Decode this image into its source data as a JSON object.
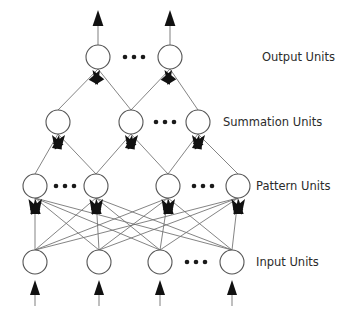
{
  "diagram": {
    "layers": [
      {
        "id": "output",
        "label": "Output Units",
        "label_x": 262,
        "label_y": 57,
        "y": 57,
        "radius": 12,
        "nodes": [
          {
            "name": "output-unit-1",
            "x": 98
          },
          {
            "name": "output-unit-2",
            "x": 170
          }
        ],
        "ellipses": [
          {
            "name": "output-ellipsis",
            "x": 134,
            "y": 57
          }
        ]
      },
      {
        "id": "summation",
        "label": "Summation Units",
        "label_x": 223,
        "label_y": 122,
        "y": 122,
        "radius": 12,
        "nodes": [
          {
            "name": "summation-unit-1",
            "x": 58
          },
          {
            "name": "summation-unit-2",
            "x": 131
          },
          {
            "name": "summation-unit-3",
            "x": 198
          }
        ],
        "ellipses": [
          {
            "name": "summation-ellipsis",
            "x": 165,
            "y": 122
          }
        ]
      },
      {
        "id": "pattern",
        "label": "Pattern Units",
        "label_x": 256,
        "label_y": 186,
        "y": 186,
        "radius": 12,
        "nodes": [
          {
            "name": "pattern-unit-1",
            "x": 35
          },
          {
            "name": "pattern-unit-2",
            "x": 96
          },
          {
            "name": "pattern-unit-3",
            "x": 168
          },
          {
            "name": "pattern-unit-4",
            "x": 238
          }
        ],
        "ellipses": [
          {
            "name": "pattern-ellipsis-left",
            "x": 65,
            "y": 186
          },
          {
            "name": "pattern-ellipsis-right",
            "x": 203,
            "y": 186
          }
        ]
      },
      {
        "id": "input",
        "label": "Input Units",
        "label_x": 256,
        "label_y": 262,
        "y": 262,
        "radius": 12,
        "nodes": [
          {
            "name": "input-unit-1",
            "x": 35
          },
          {
            "name": "input-unit-2",
            "x": 99
          },
          {
            "name": "input-unit-3",
            "x": 160
          },
          {
            "name": "input-unit-4",
            "x": 232
          }
        ],
        "ellipses": [
          {
            "name": "input-ellipsis",
            "x": 196,
            "y": 262
          }
        ]
      }
    ],
    "connections": {
      "input_to_pattern": "full",
      "pattern_to_summation": [
        {
          "from": 0,
          "to": 0
        },
        {
          "from": 1,
          "to": 0
        },
        {
          "from": 1,
          "to": 1
        },
        {
          "from": 2,
          "to": 1
        },
        {
          "from": 2,
          "to": 2
        },
        {
          "from": 3,
          "to": 2
        }
      ],
      "summation_to_output": [
        {
          "from": 0,
          "to": 0
        },
        {
          "from": 1,
          "to": 0
        },
        {
          "from": 1,
          "to": 1
        },
        {
          "from": 2,
          "to": 1
        }
      ]
    },
    "external_arrows": {
      "output_up": [
        {
          "name": "output-arrow-1",
          "x": 98,
          "top": 10
        },
        {
          "name": "output-arrow-2",
          "x": 170,
          "top": 10
        }
      ],
      "input_up": [
        {
          "name": "input-arrow-1",
          "x": 35,
          "bottom": 306
        },
        {
          "name": "input-arrow-2",
          "x": 99,
          "bottom": 306
        },
        {
          "name": "input-arrow-3",
          "x": 160,
          "bottom": 306
        },
        {
          "name": "input-arrow-4",
          "x": 232,
          "bottom": 306
        }
      ]
    },
    "style": {
      "background": "#ffffff",
      "circle_stroke": "#555555",
      "edge_stroke": "#6e6e6e",
      "arrow_fill": "#111111",
      "label_color": "#2b2b2b",
      "ellipsis_color": "#1a1a1a"
    }
  }
}
